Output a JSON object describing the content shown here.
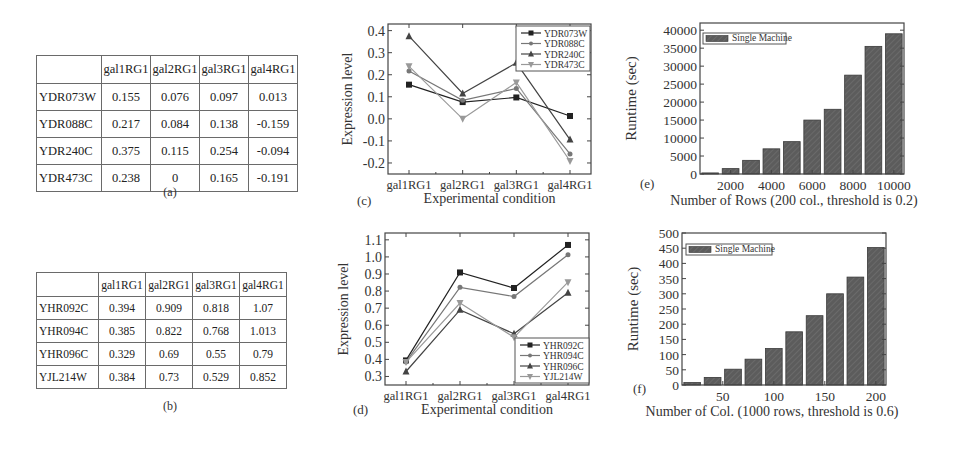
{
  "table_a": {
    "caption": "(a)",
    "columns": [
      "",
      "gal1RG1",
      "gal2RG1",
      "gal3RG1",
      "gal4RG1"
    ],
    "rows": [
      {
        "gene": "YDR073W",
        "values": [
          "0.155",
          "0.076",
          "0.097",
          "0.013"
        ]
      },
      {
        "gene": "YDR088C",
        "values": [
          "0.217",
          "0.084",
          "0.138",
          "-0.159"
        ]
      },
      {
        "gene": "YDR240C",
        "values": [
          "0.375",
          "0.115",
          "0.254",
          "-0.094"
        ]
      },
      {
        "gene": "YDR473C",
        "values": [
          "0.238",
          "0",
          "0.165",
          "-0.191"
        ]
      }
    ]
  },
  "table_b": {
    "caption": "(b)",
    "columns": [
      "",
      "gal1RG1",
      "gal2RG1",
      "gal3RG1",
      "gal4RG1"
    ],
    "rows": [
      {
        "gene": "YHR092C",
        "values": [
          "0.394",
          "0.909",
          "0.818",
          "1.07"
        ]
      },
      {
        "gene": "YHR094C",
        "values": [
          "0.385",
          "0.822",
          "0.768",
          "1.013"
        ]
      },
      {
        "gene": "YHR096C",
        "values": [
          "0.329",
          "0.69",
          "0.55",
          "0.79"
        ]
      },
      {
        "gene": "YJL214W",
        "values": [
          "0.384",
          "0.73",
          "0.529",
          "0.852"
        ]
      }
    ]
  },
  "chart_data": [
    {
      "id": "c",
      "panel_label": "(c)",
      "type": "line",
      "title": "",
      "xlabel": "Experimental condition",
      "ylabel": "Expression level",
      "categories": [
        "gal1RG1",
        "gal2RG1",
        "gal3RG1",
        "gal4RG1"
      ],
      "ylim": [
        -0.25,
        0.43
      ],
      "yticks": [
        "0.4",
        "0.3",
        "0.2",
        "0.1",
        "0.0",
        "-0.1",
        "-0.2"
      ],
      "legend_position": "upper right",
      "series": [
        {
          "name": "YDR073W",
          "marker": "square",
          "color": "#222222",
          "values": [
            0.155,
            0.076,
            0.097,
            0.013
          ]
        },
        {
          "name": "YDR088C",
          "marker": "circle",
          "color": "#777777",
          "values": [
            0.217,
            0.084,
            0.138,
            -0.159
          ]
        },
        {
          "name": "YDR240C",
          "marker": "triangle-up",
          "color": "#444444",
          "values": [
            0.375,
            0.115,
            0.254,
            -0.094
          ]
        },
        {
          "name": "YDR473C",
          "marker": "triangle-down",
          "color": "#999999",
          "values": [
            0.238,
            0.0,
            0.165,
            -0.191
          ]
        }
      ]
    },
    {
      "id": "d",
      "panel_label": "(d)",
      "type": "line",
      "title": "",
      "xlabel": "Experimental condition",
      "ylabel": "Expression level",
      "categories": [
        "gal1RG1",
        "gal2RG1",
        "gal3RG1",
        "gal4RG1"
      ],
      "ylim": [
        0.25,
        1.14
      ],
      "yticks": [
        "1.1",
        "1.0",
        "0.9",
        "0.8",
        "0.7",
        "0.6",
        "0.5",
        "0.4",
        "0.3"
      ],
      "legend_position": "lower right",
      "series": [
        {
          "name": "YHR092C",
          "marker": "square",
          "color": "#222222",
          "values": [
            0.394,
            0.909,
            0.818,
            1.07
          ]
        },
        {
          "name": "YHR094C",
          "marker": "circle",
          "color": "#777777",
          "values": [
            0.385,
            0.822,
            0.768,
            1.013
          ]
        },
        {
          "name": "YHR096C",
          "marker": "triangle-up",
          "color": "#444444",
          "values": [
            0.329,
            0.69,
            0.55,
            0.79
          ]
        },
        {
          "name": "YJL214W",
          "marker": "triangle-down",
          "color": "#999999",
          "values": [
            0.384,
            0.73,
            0.529,
            0.852
          ]
        }
      ]
    },
    {
      "id": "e",
      "panel_label": "(e)",
      "type": "bar",
      "title": "",
      "xlabel": "Number of Rows (200 col., threshold is 0.2)",
      "ylabel": "Runtime (sec)",
      "categories": [
        1000,
        2000,
        3000,
        4000,
        5000,
        6000,
        7000,
        8000,
        9000,
        10000
      ],
      "xticks": [
        "2000",
        "4000",
        "6000",
        "8000",
        "10000"
      ],
      "ylim": [
        0,
        42000
      ],
      "yticks": [
        "40000",
        "35000",
        "30000",
        "25000",
        "20000",
        "15000",
        "10000",
        "5000",
        "0"
      ],
      "legend_position": "upper left",
      "series": [
        {
          "name": "Single Machine",
          "color": "#555555",
          "values": [
            300,
            1500,
            3800,
            7000,
            9000,
            15000,
            18000,
            27500,
            35500,
            39000
          ]
        }
      ]
    },
    {
      "id": "f",
      "panel_label": "(f)",
      "type": "bar",
      "title": "",
      "xlabel": "Number of Col. (1000 rows, threshold is 0.6)",
      "ylabel": "Runtime (sec)",
      "categories": [
        20,
        40,
        60,
        80,
        100,
        120,
        140,
        160,
        180,
        200
      ],
      "xticks": [
        "50",
        "100",
        "150",
        "200"
      ],
      "ylim": [
        0,
        500
      ],
      "yticks": [
        "500",
        "450",
        "400",
        "350",
        "300",
        "250",
        "200",
        "150",
        "100",
        "50",
        "0"
      ],
      "legend_position": "upper left",
      "series": [
        {
          "name": "Single Machine",
          "color": "#555555",
          "values": [
            8,
            25,
            52,
            85,
            120,
            175,
            228,
            300,
            355,
            452
          ]
        }
      ]
    }
  ]
}
